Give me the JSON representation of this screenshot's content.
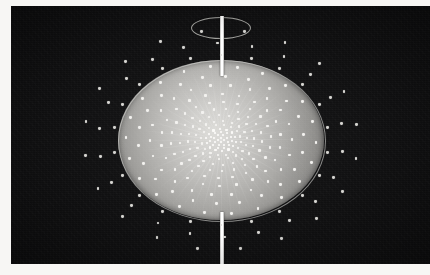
{
  "figure": {
    "title": "Spherical point distribution on a shaded ellipsoid with polar axis",
    "caption": "",
    "background_color": "#0d0d0e",
    "paper_color": "#f7f6f4",
    "point_color": "#f3f2ef",
    "sphere_highlight_color": "#d9d8d4",
    "sphere_shadow_color": "#5d5c5b",
    "axis_color": "#ffffff"
  },
  "canvas": {
    "width": 430,
    "height": 275,
    "field_left": 11,
    "field_top": 6,
    "field_width": 419,
    "field_height": 258
  },
  "sphere": {
    "label": "shaded ellipsoid body",
    "center_x": 210,
    "center_y": 134,
    "radius_x": 103,
    "radius_y": 80,
    "highlight_x_pct": 46,
    "highlight_y_pct": 44
  },
  "axis": {
    "label": "polar rotation axis",
    "x": 209,
    "width": 4,
    "top_segment": {
      "y": 10,
      "height": 60
    },
    "bottom_segment": {
      "y": 206,
      "height": 52
    }
  },
  "pole_ring": {
    "label": "north pole orbit ring",
    "center_x": 209,
    "center_y": 21,
    "radius_x": 29,
    "radius_y": 10
  },
  "chart_data": {
    "type": "scatter",
    "title": "Spherical point distribution on a shaded ellipsoid with polar axis",
    "xlabel": "",
    "ylabel": "",
    "projection": "orthographic-polar",
    "grid": false,
    "legend": null,
    "center": [
      210,
      134
    ],
    "rings": [
      {
        "radius_x": 3,
        "radius_y": 2,
        "count": 4,
        "phase": 0.0,
        "class": "core",
        "size": 2.0
      },
      {
        "radius_x": 7,
        "radius_y": 5,
        "count": 8,
        "phase": 0.35,
        "class": "core",
        "size": 2.0
      },
      {
        "radius_x": 11,
        "radius_y": 8,
        "count": 11,
        "phase": 0.7,
        "class": "core",
        "size": 2.0
      },
      {
        "radius_x": 15,
        "radius_y": 11,
        "count": 14,
        "phase": 0.15,
        "class": "core",
        "size": 2.1
      },
      {
        "radius_x": 20,
        "radius_y": 15,
        "count": 16,
        "phase": 0.55,
        "class": "",
        "size": 2.1
      },
      {
        "radius_x": 26,
        "radius_y": 19,
        "count": 18,
        "phase": 0.95,
        "class": "",
        "size": 2.2
      },
      {
        "radius_x": 33,
        "radius_y": 25,
        "count": 20,
        "phase": 0.25,
        "class": "",
        "size": 2.3
      },
      {
        "radius_x": 41,
        "radius_y": 31,
        "count": 21,
        "phase": 0.65,
        "class": "",
        "size": 2.4
      },
      {
        "radius_x": 50,
        "radius_y": 38,
        "count": 22,
        "phase": 1.05,
        "class": "",
        "size": 2.5
      },
      {
        "radius_x": 60,
        "radius_y": 46,
        "count": 22,
        "phase": 0.45,
        "class": "",
        "size": 2.6
      },
      {
        "radius_x": 71,
        "radius_y": 55,
        "count": 22,
        "phase": 0.85,
        "class": "",
        "size": 2.7
      },
      {
        "radius_x": 83,
        "radius_y": 64,
        "count": 22,
        "phase": 0.2,
        "class": "",
        "size": 2.8
      },
      {
        "radius_x": 95,
        "radius_y": 74,
        "count": 22,
        "phase": 0.6,
        "class": "",
        "size": 2.9
      },
      {
        "radius_x": 108,
        "radius_y": 85,
        "count": 22,
        "phase": 1.0,
        "class": "dim",
        "size": 2.9
      },
      {
        "radius_x": 122,
        "radius_y": 97,
        "count": 22,
        "phase": 0.4,
        "class": "dim",
        "size": 2.9
      },
      {
        "radius_x": 137,
        "radius_y": 110,
        "count": 20,
        "phase": 0.8,
        "class": "dim",
        "size": 2.9
      }
    ],
    "total_points": 264,
    "xlim": [
      -140,
      140
    ],
    "ylim": [
      -115,
      115
    ]
  },
  "mesh": {
    "spoke_count": 48
  }
}
